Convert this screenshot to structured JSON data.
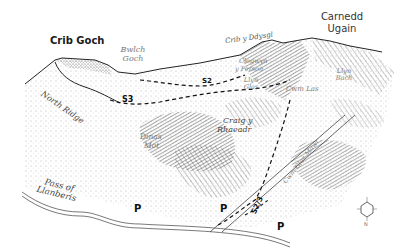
{
  "map": {
    "style": "pen-and-ink panoramic relief illustration",
    "colors": {
      "ink": "#1a1a1a",
      "label_grey": "#777777",
      "paper": "#ffffff"
    },
    "peaks": [
      {
        "name": "Crib Goch",
        "style": "bold"
      },
      {
        "name": "Carnedd Ugain",
        "line1": "Carnedd",
        "line2": "Ugain"
      }
    ],
    "features": {
      "bwlch_goch": {
        "line1": "Bwlch",
        "line2": "Goch"
      },
      "crib_y_ddysgl": "Crib y Ddysgl",
      "clogwyn_y_person": {
        "line1": "Clogwyn",
        "line2": "y Person"
      },
      "llyn_glas": {
        "line1": "Llyn",
        "line2": "Glas"
      },
      "llyn_bach": {
        "line1": "Llyn",
        "line2": "Bach"
      },
      "cwm_las": "Cwm Las",
      "north_ridge": "North Ridge",
      "craig_y_rhaeadr": {
        "line1": "Craig y",
        "line2": "Rhaeadr"
      },
      "dinas_mot": {
        "line1": "Dinas",
        "line2": "Mot"
      },
      "cwm_glas_mawr": "Cwm Glas Mawr",
      "pass_of_llanberis": {
        "line1": "Pass of",
        "line2": "Llanberis"
      }
    },
    "routes": [
      "S3",
      "S2",
      "S2/3"
    ],
    "parking": [
      "P",
      "P",
      "P"
    ],
    "compass": {
      "north": "N",
      "labels": [
        "N",
        "E",
        "S",
        "W"
      ]
    }
  }
}
